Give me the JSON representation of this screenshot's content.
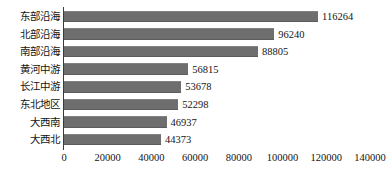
{
  "chart_data": {
    "type": "bar",
    "orientation": "horizontal",
    "title": "",
    "subtitle": "",
    "xlabel": "",
    "ylabel": "",
    "categories": [
      "东部沿海",
      "北部沿海",
      "南部沿海",
      "黄河中游",
      "长江中游",
      "东北地区",
      "大西南",
      "大西北"
    ],
    "values": [
      116264,
      96240,
      88805,
      56815,
      53678,
      52298,
      46937,
      44373
    ],
    "data_labels": [
      "116264",
      "96240",
      "88805",
      "56815",
      "53678",
      "52298",
      "46937",
      "44373"
    ],
    "xlim": [
      0,
      140000
    ],
    "xticks": [
      0,
      20000,
      40000,
      60000,
      80000,
      100000,
      120000,
      140000
    ],
    "xtick_labels": [
      "0",
      "20000",
      "40000",
      "60000",
      "80000",
      "100000",
      "120000",
      "140000"
    ],
    "grid": false,
    "legend": false,
    "legend_position": "none",
    "bar_color": "#6e6e6e",
    "axis_color": "#3a3a3a",
    "text_color": "#141414",
    "background": "#ffffff",
    "show_data_labels": true
  }
}
